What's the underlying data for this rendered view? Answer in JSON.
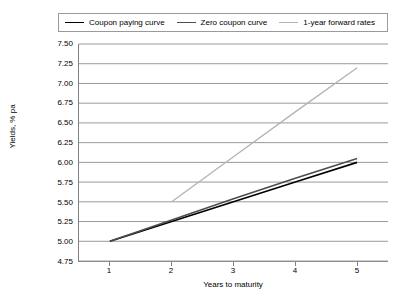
{
  "chart_data": {
    "type": "line",
    "title": "",
    "xlabel": "Years to maturity",
    "ylabel": "Yields, % pa",
    "xlim": [
      0.5,
      5.5
    ],
    "ylim": [
      4.75,
      7.5
    ],
    "grid": true,
    "legend_position": "top",
    "x_ticks": [
      "1",
      "2",
      "3",
      "4",
      "5"
    ],
    "y_ticks": [
      "7.50",
      "7.25",
      "7.00",
      "6.75",
      "6.50",
      "6.25",
      "6.00",
      "5.75",
      "5.50",
      "5.25",
      "5.00",
      "4.75"
    ],
    "series": [
      {
        "name": "Coupon paying curve",
        "color": "#000000",
        "width": 1.6,
        "x": [
          1,
          2,
          3,
          4,
          5
        ],
        "values": [
          5.0,
          5.25,
          5.5,
          5.75,
          6.0
        ]
      },
      {
        "name": "Zero coupon curve",
        "color": "#4d4d4d",
        "width": 1.6,
        "x": [
          1,
          2,
          3,
          4,
          5
        ],
        "values": [
          5.0,
          5.27,
          5.54,
          5.8,
          6.05
        ]
      },
      {
        "name": "1-year forward rates",
        "color": "#b3b3b3",
        "width": 1.3,
        "x": [
          2,
          3,
          4,
          5
        ],
        "values": [
          5.5,
          6.07,
          6.64,
          7.2
        ]
      }
    ]
  }
}
